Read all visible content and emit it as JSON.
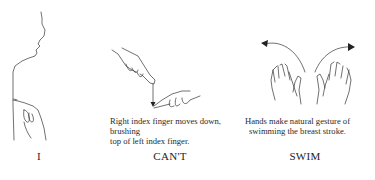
{
  "signs": [
    {
      "word": "I",
      "caption": "",
      "illustration": "profile-pointing-to-chest"
    },
    {
      "word": "CAN'T",
      "caption_lines": [
        "Right index finger moves down, brushing",
        "top of left index finger."
      ],
      "illustration": "index-finger-brush-down"
    },
    {
      "word": "SWIM",
      "caption_lines": [
        "Hands make natural gesture of",
        "swimming the breast stroke."
      ],
      "illustration": "breast-stroke-hands"
    }
  ],
  "colors": {
    "ink": "#2a2a2a",
    "background": "#ffffff"
  }
}
